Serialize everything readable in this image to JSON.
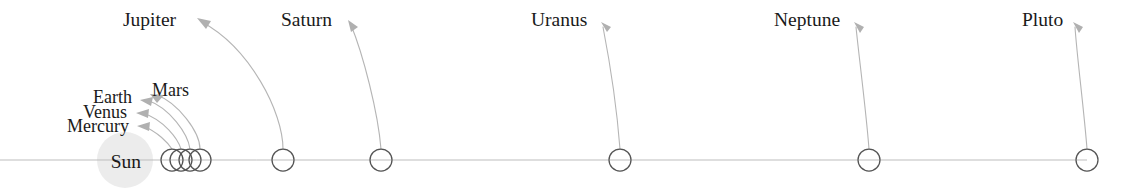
{
  "diagram": {
    "background_color": "#ffffff",
    "baseline_color": "#b9b9b9",
    "planet_outline_color": "#4a4a4a",
    "sun_fill_color": "#ececec",
    "leader_color": "#b3b3b3",
    "label_color": "#1a1a1a",
    "axis": {
      "baseline_y": 160,
      "baseline_x_start": 0,
      "baseline_x_end": 1087
    },
    "sun": {
      "label": "Sun",
      "center_x": 125,
      "center_y": 160,
      "radius": 28,
      "label_x": 113,
      "label_y": 168
    },
    "bodies": [
      {
        "name": "Mercury",
        "label": "Mercury",
        "circle_x": 172,
        "circle_y": 160,
        "circle_r": 11,
        "label_x": 129,
        "label_y": 131,
        "arrow_tip_x": 137,
        "arrow_tip_y": 126,
        "leader_type": "arc",
        "group": "inner"
      },
      {
        "name": "Venus",
        "label": "Venus",
        "circle_x": 181,
        "circle_y": 160,
        "circle_r": 11,
        "label_x": 127,
        "label_y": 117,
        "arrow_tip_x": 136,
        "arrow_tip_y": 113,
        "leader_type": "arc",
        "group": "inner"
      },
      {
        "name": "Earth",
        "label": "Earth",
        "circle_x": 190,
        "circle_y": 160,
        "circle_r": 11,
        "label_x": 132,
        "label_y": 103,
        "arrow_tip_x": 140,
        "arrow_tip_y": 100,
        "leader_type": "arc",
        "group": "inner"
      },
      {
        "name": "Mars",
        "label": "Mars",
        "circle_x": 200,
        "circle_y": 160,
        "circle_r": 11,
        "label_x": 152,
        "label_y": 93,
        "arrow_tip_x": 152,
        "arrow_tip_y": 95,
        "leader_type": "arc",
        "group": "inner"
      },
      {
        "name": "Jupiter",
        "label": "Jupiter",
        "circle_x": 283,
        "circle_y": 160,
        "circle_r": 11,
        "label_x": 123,
        "label_y": 20,
        "arrow_tip_x": 197,
        "arrow_tip_y": 18,
        "leader_type": "curve",
        "group": "outer"
      },
      {
        "name": "Saturn",
        "label": "Saturn",
        "circle_x": 381,
        "circle_y": 160,
        "circle_r": 11,
        "label_x": 281,
        "label_y": 20,
        "arrow_tip_x": 348,
        "arrow_tip_y": 20,
        "leader_type": "curve",
        "group": "outer"
      },
      {
        "name": "Uranus",
        "label": "Uranus",
        "circle_x": 620,
        "circle_y": 160,
        "circle_r": 11,
        "label_x": 531,
        "label_y": 20,
        "arrow_tip_x": 601,
        "arrow_tip_y": 22,
        "leader_type": "curve",
        "group": "outer"
      },
      {
        "name": "Neptune",
        "label": "Neptune",
        "circle_x": 869,
        "circle_y": 160,
        "circle_r": 11,
        "label_x": 774,
        "label_y": 20,
        "arrow_tip_x": 854,
        "arrow_tip_y": 22,
        "leader_type": "curve",
        "group": "outer"
      },
      {
        "name": "Pluto",
        "label": "Pluto",
        "circle_x": 1087,
        "circle_y": 160,
        "circle_r": 11,
        "label_x": 1022,
        "label_y": 20,
        "arrow_tip_x": 1073,
        "arrow_tip_y": 22,
        "leader_type": "curve",
        "group": "outer"
      }
    ]
  }
}
